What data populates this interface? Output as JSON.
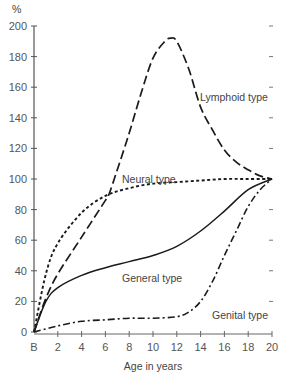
{
  "chart_data": {
    "type": "line",
    "title": "",
    "xlabel": "Age in years",
    "ylabel": "%",
    "xlim": [
      0,
      20
    ],
    "ylim": [
      0,
      200
    ],
    "x_ticks": [
      0,
      2,
      4,
      6,
      8,
      10,
      12,
      14,
      16,
      18,
      20
    ],
    "x_tick_labels": [
      "B",
      "2",
      "4",
      "6",
      "8",
      "10",
      "12",
      "14",
      "16",
      "18",
      "20"
    ],
    "y_ticks": [
      0,
      20,
      40,
      60,
      80,
      100,
      120,
      140,
      160,
      180,
      200
    ],
    "y_tick_labels": [
      "0",
      "20",
      "40",
      "60",
      "80",
      "100",
      "120",
      "140",
      "160",
      "180",
      "200"
    ],
    "grid": false,
    "legend": "inline labels",
    "series": [
      {
        "name": "Lymphoid type",
        "style": "long-dash",
        "x": [
          0,
          1,
          2,
          4,
          6,
          6.3,
          7,
          8,
          9,
          10,
          11,
          11.5,
          12,
          13,
          14,
          15,
          16,
          17,
          18,
          19,
          20
        ],
        "values": [
          0,
          22,
          38,
          62,
          86,
          90,
          106,
          130,
          156,
          179,
          190,
          192,
          190,
          172,
          147,
          132,
          119,
          111,
          106,
          102,
          100
        ]
      },
      {
        "name": "Neural type",
        "style": "short-dash",
        "x": [
          0,
          1,
          2,
          4,
          6,
          8,
          10,
          12,
          14,
          16,
          18,
          20
        ],
        "values": [
          0,
          38,
          58,
          78,
          89,
          94,
          97,
          98,
          99,
          100,
          100,
          100
        ]
      },
      {
        "name": "General type",
        "style": "solid",
        "x": [
          0,
          1,
          2,
          4,
          6,
          8,
          10,
          12,
          14,
          16,
          18,
          20
        ],
        "values": [
          0,
          20,
          29,
          37,
          42,
          46,
          50,
          56,
          66,
          79,
          93,
          100
        ]
      },
      {
        "name": "Genital type",
        "style": "dash-dot",
        "x": [
          0,
          2,
          4,
          6,
          8,
          10,
          12,
          13,
          14,
          15,
          16,
          17,
          18,
          19,
          20
        ],
        "values": [
          0,
          4,
          7,
          8,
          9,
          9,
          10,
          13,
          20,
          33,
          50,
          66,
          82,
          93,
          100
        ]
      }
    ],
    "annotations": [
      {
        "text": "Lymphoid type",
        "x": 15.5,
        "y": 168
      },
      {
        "text": "Neural type",
        "x": 8.6,
        "y": 106
      },
      {
        "text": "General type",
        "x": 9.6,
        "y": 36
      },
      {
        "text": "Genital type",
        "x": 16.5,
        "y": 10
      }
    ]
  },
  "labels": {
    "y_unit": "%",
    "x_axis_title": "Age in years",
    "lymphoid": "Lymphoid type",
    "neural": "Neural type",
    "general": "General type",
    "genital": "Genital type"
  }
}
